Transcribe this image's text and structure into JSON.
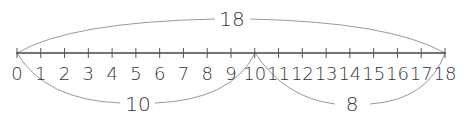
{
  "number_line": {
    "start": 0,
    "end": 18,
    "ticks": [
      "0",
      "1",
      "2",
      "3",
      "4",
      "5",
      "6",
      "7",
      "8",
      "9",
      "10",
      "11",
      "12",
      "13",
      "14",
      "15",
      "16",
      "17",
      "18"
    ],
    "color": "#444444"
  },
  "arcs": {
    "top": {
      "from": 0,
      "to": 18,
      "label": "18"
    },
    "bottom_left": {
      "from": 0,
      "to": 10,
      "label": "10"
    },
    "bottom_right": {
      "from": 10,
      "to": 18,
      "label": "8"
    }
  }
}
